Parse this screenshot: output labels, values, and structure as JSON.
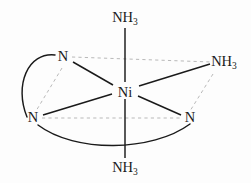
{
  "diagram": {
    "type": "chemical-structure",
    "colors": {
      "background": "#fdfdfd",
      "bond": "#1a1a1a",
      "dashed_bond": "#b9b9b9",
      "label": "#1a1a1a"
    },
    "center_atom": {
      "label": "Ni",
      "x": 125,
      "y": 92
    },
    "ligands": [
      {
        "id": "ammine-top",
        "element": "N",
        "formula": "NH",
        "subscript": "3",
        "label": "NH3",
        "x": 125,
        "y": 22,
        "bond": "solid"
      },
      {
        "id": "ammine-right",
        "element": "N",
        "formula": "NH",
        "subscript": "3",
        "label": "NH3",
        "x": 222,
        "y": 66,
        "bond": "solid"
      },
      {
        "id": "ammine-bottom",
        "element": "N",
        "formula": "NH",
        "subscript": "3",
        "label": "NH3",
        "x": 125,
        "y": 170,
        "bond": "solid"
      },
      {
        "id": "amine-upper-left",
        "element": "N",
        "formula": "N",
        "subscript": "",
        "label": "N",
        "x": 63,
        "y": 60,
        "bond": "solid"
      },
      {
        "id": "amine-lower-left",
        "element": "N",
        "formula": "N",
        "subscript": "",
        "label": "N",
        "x": 33,
        "y": 120,
        "bond": "solid"
      },
      {
        "id": "amine-lower-right",
        "element": "N",
        "formula": "N",
        "subscript": "",
        "label": "N",
        "x": 190,
        "y": 120,
        "bond": "solid"
      }
    ],
    "chelate_rings": [
      {
        "id": "chelate-left",
        "from": "amine-upper-left",
        "to": "amine-lower-left",
        "style": "arc-left"
      },
      {
        "id": "chelate-bottom",
        "from": "amine-lower-left",
        "to": "amine-lower-right",
        "style": "arc-bottom"
      }
    ],
    "dashed_guides": [
      {
        "id": "guide-equatorial-upper",
        "from": "amine-upper-left",
        "to": "ammine-right"
      },
      {
        "id": "guide-equatorial-lower",
        "from": "amine-lower-left",
        "to": "amine-lower-right"
      },
      {
        "id": "guide-left-vertical",
        "from": "amine-upper-left",
        "to": "amine-lower-left"
      },
      {
        "id": "guide-right-vertical",
        "from": "ammine-right",
        "to": "amine-lower-right"
      }
    ]
  }
}
